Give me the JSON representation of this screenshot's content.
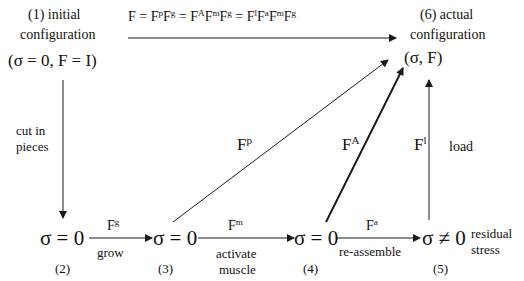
{
  "diagram": {
    "type": "commutative-deformation-diagram",
    "nodes": {
      "n1": {
        "label_num": "(1) initial",
        "label_desc": "configuration",
        "state": "(σ = 0, F = I)"
      },
      "n2": {
        "state": "σ = 0",
        "num": "(2)"
      },
      "n3": {
        "state": "σ = 0",
        "num": "(3)"
      },
      "n4": {
        "state": "σ = 0",
        "num": "(4)"
      },
      "n5": {
        "state": "σ ≠ 0",
        "num": "(5)",
        "note_line1": "residual",
        "note_line2": "stress"
      },
      "n6": {
        "label_num": "(6) actual",
        "label_desc": "configuration",
        "state": "(σ, F)"
      }
    },
    "top_equation": {
      "base": "F = F",
      "parts": [
        {
          "text": "F = F",
          "sup": "p"
        },
        {
          "text": "F",
          "sup": "g"
        },
        {
          "text": " = F",
          "sup": "A"
        },
        {
          "text": "F",
          "sup": "m"
        },
        {
          "text": "F",
          "sup": "g"
        },
        {
          "text": " = F",
          "sup": "l"
        },
        {
          "text": "F",
          "sup": "a"
        },
        {
          "text": "F",
          "sup": "m"
        },
        {
          "text": "F",
          "sup": "g"
        }
      ]
    },
    "edges": {
      "cut": {
        "line1": "cut in",
        "line2": "pieces"
      },
      "grow": {
        "symbol": "F",
        "sup": "g",
        "desc": "grow"
      },
      "activate": {
        "symbol": "F",
        "sup": "m",
        "desc1": "activate",
        "desc2": "muscle"
      },
      "reassemble": {
        "symbol": "F",
        "sup": "a",
        "desc": "re-assemble"
      },
      "fp": {
        "symbol": "F",
        "sup": "p"
      },
      "fa": {
        "symbol": "F",
        "sup": "A"
      },
      "load": {
        "symbol": "F",
        "sup": "l",
        "desc": "load"
      }
    },
    "line_color": "#1a1a1a"
  }
}
